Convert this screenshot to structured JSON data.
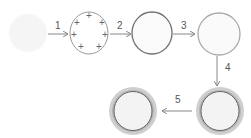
{
  "diagram": {
    "steps": [
      {
        "label": "1"
      },
      {
        "label": "2"
      },
      {
        "label": "3"
      },
      {
        "label": "4"
      },
      {
        "label": "5"
      }
    ],
    "nodes": [
      {
        "id": "state-1",
        "description": "faint blob"
      },
      {
        "id": "state-2",
        "description": "circle with positive charges",
        "charge_symbol": "+"
      },
      {
        "id": "state-3",
        "description": "dark outlined circle"
      },
      {
        "id": "state-4",
        "description": "light outlined circle"
      },
      {
        "id": "state-5",
        "description": "thick-ringed circle"
      },
      {
        "id": "state-6",
        "description": "thick-ringed circle"
      }
    ],
    "colors": {
      "blob": "#f4f4f4",
      "dark_stroke": "#777777",
      "light_stroke": "#aaaaaa",
      "ring": "#bdbdbd",
      "fill": "#f3f3f3",
      "arrow": "#888888"
    }
  }
}
